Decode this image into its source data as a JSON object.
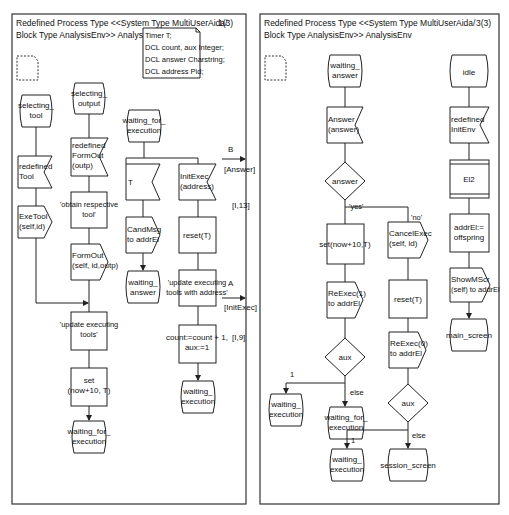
{
  "pages": [
    {
      "header_line1": "Redefined Process Type <<System Type MultiUserAida/",
      "header_line2": "Block Type AnalysisEnv>> AnalysisEnv",
      "page_number": "1(3)",
      "declarations": [
        "Timer T;",
        "DCL count, aux Integer;",
        "DCL answer Charstring;",
        "DCL address Pid;"
      ],
      "states": {
        "selecting_tool": "selecting_\ntool",
        "selecting_output": "selecting_\noutput",
        "waiting_for_execution": "waiting_for_\nexecution",
        "waiting_answer": "waiting_\nanswer",
        "waiting_execution": "waiting_\nexecution",
        "waiting_for_execution_end": "waiting_for_\nexecution"
      },
      "inputs": {
        "redefined_tool": "redefined\nTool",
        "redefined_formout": "redefined\nFormOut\n(outp)",
        "timer_t": "T",
        "initexec": "InitExec\n(address)"
      },
      "outputs": {
        "exetool": "ExeTool\n(self,id)",
        "formout": "FormOut\n(self, id,outp)",
        "candmsg": "CandMsg\nto addrEl"
      },
      "tasks": {
        "obtain_tool": "'obtain respective\ntool'",
        "update_tools": "'update executing\ntools'",
        "set_timer": "set\n(now+10, T)",
        "reset_t": "reset(T)",
        "update_with_address": "'update executing\ntools with address'",
        "count_inc": "count:=count + 1,\naux:=1"
      },
      "gates": [
        {
          "name": "B",
          "signal": "[Answer]",
          "ref": "[I,13]"
        },
        {
          "name": "A",
          "signal": "[InitExec]",
          "ref": "[I,9]"
        }
      ]
    },
    {
      "header_line1": "Redefined Process Type <<System Type MultiUserAida/",
      "header_line2": "Block Type AnalysisEnv>> AnalysisEnv",
      "page_number": "3(3)",
      "states": {
        "waiting_answer": "waiting_\nanswer",
        "idle": "idle",
        "waiting_execution_1": "waiting_\nexecution",
        "waiting_for_execution": "waiting_for_\nexecution",
        "waiting_execution_2": "waiting_\nexecution",
        "session_screen": "session_screen",
        "main_screen": "main_screen"
      },
      "inputs": {
        "answer": "Answer\n(answer)",
        "redefined_initenv": "redefined\nInitEnv"
      },
      "decisions": {
        "answer": "answer",
        "aux1": "aux",
        "aux2": "aux"
      },
      "labels": {
        "yes": "'yes'",
        "no": "'no'",
        "one_a": "1",
        "else_a": "else",
        "one_b": "1",
        "else_b": "else"
      },
      "tasks": {
        "set_timer": "set(now+10,T)",
        "reset_t": "reset(T)",
        "addrel": "addrEl:=\noffspring"
      },
      "outputs": {
        "reexec1": "ReExec(1)\nto addrEl",
        "cancelexec": "CancelExec\n(self, id)",
        "reexec0": "ReExec(0)\nto addrEl",
        "showmscr": "ShowMScr\n(self) to addrEl"
      },
      "create": {
        "el2": "El2"
      }
    }
  ]
}
